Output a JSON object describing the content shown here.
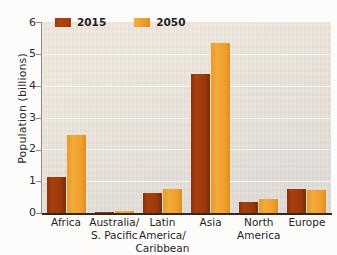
{
  "chart_data": {
    "type": "bar",
    "title": "",
    "xlabel": "",
    "ylabel": "Population (billions)",
    "ylim": [
      0,
      6
    ],
    "ytick_labels": [
      "6",
      "5",
      "4",
      "3",
      "2",
      "1",
      "0"
    ],
    "ytick_values": [
      6,
      5,
      4,
      3,
      2,
      1,
      0
    ],
    "grid": true,
    "legend_position": "top-left",
    "categories": [
      "Africa",
      "Australia/ S. Pacific",
      "Latin America/ Caribbean",
      "Asia",
      "North America",
      "Europe"
    ],
    "category_lines": [
      [
        "Africa",
        ""
      ],
      [
        "Australia/",
        "S. Pacific"
      ],
      [
        "Latin America/",
        "Caribbean"
      ],
      [
        "Asia",
        ""
      ],
      [
        "North",
        "America"
      ],
      [
        "Europe",
        ""
      ]
    ],
    "series": [
      {
        "name": "2015",
        "color": "#9b3a0c",
        "values": [
          1.12,
          0.04,
          0.63,
          4.38,
          0.36,
          0.74
        ]
      },
      {
        "name": "2050",
        "color": "#efa030",
        "values": [
          2.44,
          0.06,
          0.77,
          5.34,
          0.45,
          0.73
        ]
      }
    ]
  },
  "colors": {
    "series_2015": "#9b3a0c",
    "series_2050": "#efa030",
    "plot_background": "#e9e2d9",
    "axis": "#2d2a26",
    "gridline": "#ffffff",
    "text": "#1f1f1f"
  }
}
